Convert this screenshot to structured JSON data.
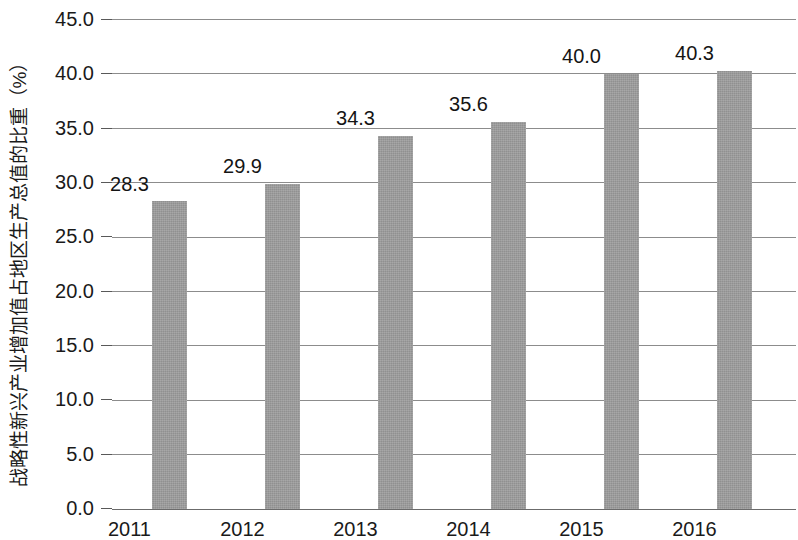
{
  "chart_data": {
    "type": "bar",
    "title": "",
    "xlabel": "",
    "ylabel": "战略性新兴产业增加值占地区生产总值的比重（%）",
    "categories": [
      "2011",
      "2012",
      "2013",
      "2014",
      "2015",
      "2016"
    ],
    "values": [
      28.3,
      29.9,
      34.3,
      35.6,
      40.0,
      40.3
    ],
    "value_labels": [
      "28.3",
      "29.9",
      "34.3",
      "35.6",
      "40.0",
      "40.3"
    ],
    "series": [
      {
        "name": "战略性新兴产业增加值占地区生产总值的比重",
        "values": [
          28.3,
          29.9,
          34.3,
          35.6,
          40.0,
          40.3
        ]
      }
    ],
    "ylim": [
      0.0,
      45.0
    ],
    "y_ticks": [
      0.0,
      5.0,
      10.0,
      15.0,
      20.0,
      25.0,
      30.0,
      35.0,
      40.0,
      45.0
    ],
    "y_tick_labels": [
      "0.0",
      "5.0",
      "10.0",
      "15.0",
      "20.0",
      "25.0",
      "30.0",
      "35.0",
      "40.0",
      "45.0"
    ],
    "grid": true,
    "grid_axis": "y",
    "legend": false,
    "legend_position": "none",
    "bar_color": "#9d9d9d",
    "gridline_color": "#8c8c8c",
    "axis_color": "#6b6b6b",
    "text_color": "#1a1a1a",
    "background_color": "#ffffff",
    "show_data_labels": true
  }
}
